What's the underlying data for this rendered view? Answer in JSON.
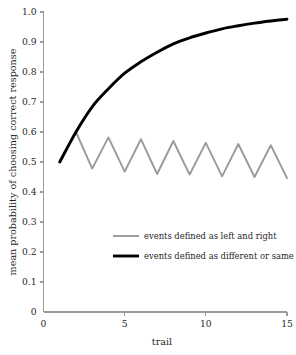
{
  "chart_data": {
    "type": "line",
    "title": "",
    "xlabel": "trail",
    "ylabel": "mean probability of choosing correct response",
    "xlim": [
      0,
      15
    ],
    "ylim": [
      0,
      1.0
    ],
    "grid": false,
    "legend_position": "inside-lower-center",
    "x_ticks": [
      0,
      5,
      10,
      15
    ],
    "x_tick_labels": [
      "0",
      "5",
      "10",
      "15"
    ],
    "y_ticks": [
      0,
      0.1,
      0.2,
      0.3,
      0.4,
      0.5,
      0.6,
      0.7,
      0.8,
      0.9,
      1.0
    ],
    "y_tick_labels": [
      "0",
      "0.1",
      "0.2",
      "0.3",
      "0.4",
      "0.5",
      "0.6",
      "0.7",
      "0.8",
      "0.9",
      "1.0"
    ],
    "x": [
      1,
      2,
      3,
      4,
      5,
      6,
      7,
      8,
      9,
      10,
      11,
      12,
      13,
      14,
      15
    ],
    "series": [
      {
        "name": "events defined as left and right",
        "color": "#9a9a9a",
        "width": 1.9,
        "smooth": false,
        "values": [
          0.5,
          0.6,
          0.478,
          0.582,
          0.468,
          0.576,
          0.46,
          0.57,
          0.458,
          0.564,
          0.452,
          0.56,
          0.45,
          0.556,
          0.446
        ]
      },
      {
        "name": "events defined as different or same",
        "color": "#000000",
        "width": 2.9,
        "smooth": true,
        "values": [
          0.5,
          0.6,
          0.684,
          0.744,
          0.796,
          0.834,
          0.866,
          0.894,
          0.914,
          0.93,
          0.944,
          0.954,
          0.963,
          0.97,
          0.976
        ]
      }
    ],
    "legend": [
      {
        "label": "events defined as left and right",
        "color": "#9a9a9a",
        "width": 1.9
      },
      {
        "label": "events defined as different or same",
        "color": "#000000",
        "width": 2.9
      }
    ]
  },
  "axes": {
    "x_axis_name": "trail-axis",
    "y_axis_name": "probability-axis"
  }
}
